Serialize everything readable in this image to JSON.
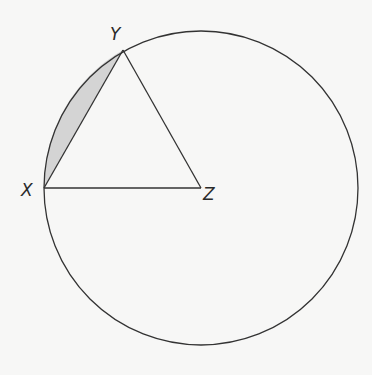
{
  "diagram": {
    "type": "geometry",
    "circle": {
      "center": "Z",
      "cx": 201,
      "cy": 188,
      "r": 157
    },
    "points": {
      "X": {
        "label": "X",
        "x": 44,
        "y": 188
      },
      "Y": {
        "label": "Y",
        "x": 123,
        "y": 50
      },
      "Z": {
        "label": "Z",
        "x": 201,
        "y": 188
      }
    },
    "segments": [
      [
        "X",
        "Y"
      ],
      [
        "Y",
        "Z"
      ],
      [
        "X",
        "Z"
      ]
    ],
    "shaded_region": {
      "between": "chord XY and minor arc XY",
      "color": "#d4d4d4"
    },
    "colors": {
      "stroke": "#333333",
      "background": "#f7f7f6",
      "shade": "#d4d4d4"
    }
  }
}
